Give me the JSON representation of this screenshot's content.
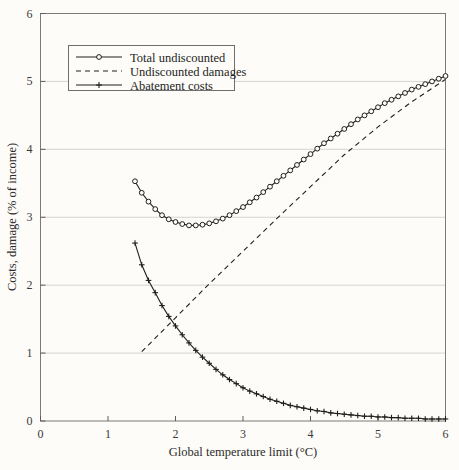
{
  "chart_data": {
    "type": "line",
    "title": "",
    "xlabel": "Global temperature limit (°C)",
    "ylabel": "Costs, damage (% of income)",
    "xlim": [
      0,
      6
    ],
    "ylim": [
      0,
      6
    ],
    "xticks": [
      0,
      1,
      2,
      3,
      4,
      5,
      6
    ],
    "yticks": [
      0,
      1,
      2,
      3,
      4,
      5,
      6
    ],
    "xtick_labels": [
      "0",
      "1",
      "2",
      "3",
      "4",
      "5",
      "6"
    ],
    "ytick_labels": [
      "0",
      "1",
      "2",
      "3",
      "4",
      "5",
      "6"
    ],
    "grid": "horizontal",
    "legend_position": "upper-left-inside",
    "series": [
      {
        "name": "Total undiscounted",
        "marker": "open-circle",
        "linestyle": "solid",
        "color": "#1f1f1f",
        "x": [
          1.4,
          1.5,
          1.6,
          1.7,
          1.8,
          1.9,
          2.0,
          2.1,
          2.2,
          2.3,
          2.4,
          2.5,
          2.6,
          2.7,
          2.8,
          2.9,
          3.0,
          3.1,
          3.2,
          3.3,
          3.4,
          3.5,
          3.6,
          3.7,
          3.8,
          3.9,
          4.0,
          4.1,
          4.2,
          4.3,
          4.4,
          4.5,
          4.6,
          4.7,
          4.8,
          4.9,
          5.0,
          5.1,
          5.2,
          5.3,
          5.4,
          5.5,
          5.6,
          5.7,
          5.8,
          5.9,
          6.0
        ],
        "y": [
          3.53,
          3.36,
          3.23,
          3.12,
          3.03,
          2.97,
          2.93,
          2.9,
          2.88,
          2.88,
          2.89,
          2.91,
          2.94,
          2.98,
          3.03,
          3.09,
          3.15,
          3.22,
          3.29,
          3.37,
          3.45,
          3.53,
          3.61,
          3.69,
          3.77,
          3.85,
          3.93,
          4.01,
          4.09,
          4.16,
          4.23,
          4.3,
          4.37,
          4.44,
          4.5,
          4.56,
          4.62,
          4.68,
          4.73,
          4.78,
          4.83,
          4.88,
          4.92,
          4.96,
          5.0,
          5.04,
          5.08
        ]
      },
      {
        "name": "Undiscounted damages",
        "marker": "none",
        "linestyle": "dashed",
        "color": "#1f1f1f",
        "x": [
          1.5,
          2.0,
          2.5,
          3.0,
          3.5,
          4.0,
          4.5,
          5.0,
          5.5,
          6.0
        ],
        "y": [
          1.02,
          1.52,
          2.02,
          2.5,
          2.98,
          3.45,
          3.92,
          4.33,
          4.7,
          5.03
        ]
      },
      {
        "name": "Abatement costs",
        "marker": "plus",
        "linestyle": "solid",
        "color": "#1f1f1f",
        "x": [
          1.4,
          1.5,
          1.6,
          1.7,
          1.8,
          1.9,
          2.0,
          2.1,
          2.2,
          2.3,
          2.4,
          2.5,
          2.6,
          2.7,
          2.8,
          2.9,
          3.0,
          3.1,
          3.2,
          3.3,
          3.4,
          3.5,
          3.6,
          3.7,
          3.8,
          3.9,
          4.0,
          4.1,
          4.2,
          4.3,
          4.4,
          4.5,
          4.6,
          4.7,
          4.8,
          4.9,
          5.0,
          5.1,
          5.2,
          5.3,
          5.4,
          5.5,
          5.6,
          5.7,
          5.8,
          5.9,
          6.0
        ],
        "y": [
          2.62,
          2.3,
          2.07,
          1.89,
          1.7,
          1.54,
          1.4,
          1.27,
          1.15,
          1.04,
          0.94,
          0.85,
          0.76,
          0.68,
          0.61,
          0.55,
          0.49,
          0.44,
          0.4,
          0.36,
          0.32,
          0.29,
          0.26,
          0.23,
          0.21,
          0.19,
          0.17,
          0.15,
          0.14,
          0.12,
          0.11,
          0.1,
          0.09,
          0.08,
          0.07,
          0.07,
          0.06,
          0.06,
          0.05,
          0.05,
          0.04,
          0.04,
          0.04,
          0.03,
          0.03,
          0.03,
          0.03
        ]
      }
    ]
  },
  "legend": {
    "entries": [
      {
        "label": "Total undiscounted",
        "style": "solid-circle"
      },
      {
        "label": "Undiscounted damages",
        "style": "dashed"
      },
      {
        "label": "Abatement costs",
        "style": "solid-plus"
      }
    ]
  },
  "axes": {
    "x_title": "Global temperature limit (°C)",
    "y_title": "Costs, damage (% of income)"
  },
  "colors": {
    "ink": "#1f1f1f",
    "grid": "#d6d4cf",
    "border": "#7a7a7a",
    "background": "#fdfcf8"
  }
}
